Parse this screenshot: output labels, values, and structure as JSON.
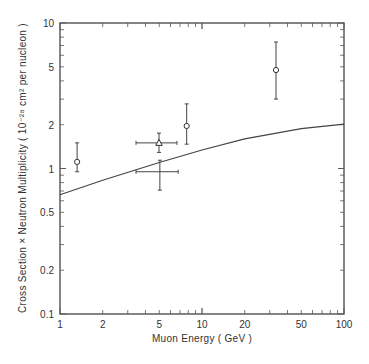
{
  "chart_data": {
    "type": "scatter",
    "title": "",
    "xlabel": "Muon Energy   ( GeV )",
    "ylabel": "Cross Section × Neutron Multiplicity ( 10⁻²⁸ cm² per nucleon )",
    "xscale": "log",
    "yscale": "log",
    "xlim": [
      1,
      100
    ],
    "ylim": [
      0.1,
      10
    ],
    "grid": false,
    "legend": null,
    "x_ticks": [
      1,
      2,
      5,
      10,
      20,
      50,
      100
    ],
    "x_tick_labels": [
      "1",
      "2",
      "5",
      "10",
      "20",
      "50",
      "100"
    ],
    "y_ticks": [
      0.1,
      0.2,
      0.5,
      1,
      2,
      5,
      10
    ],
    "y_tick_labels": [
      "0.1",
      "0.2",
      "0.5",
      "1",
      "2",
      "5",
      "10"
    ],
    "series": [
      {
        "name": "circle data points",
        "marker": "open-circle",
        "points": [
          {
            "x": 1.32,
            "y": 1.11,
            "y_low": 0.95,
            "y_high": 1.5
          },
          {
            "x": 7.8,
            "y": 1.96,
            "y_low": 1.47,
            "y_high": 2.78
          },
          {
            "x": 33.2,
            "y": 4.75,
            "y_low": 3.0,
            "y_high": 7.4
          }
        ]
      },
      {
        "name": "triangle data point",
        "marker": "open-triangle",
        "points": [
          {
            "x": 4.98,
            "y": 1.5,
            "x_low": 3.43,
            "x_high": 6.66,
            "y_low": 1.29,
            "y_high": 1.75
          }
        ]
      },
      {
        "name": "cross data point",
        "marker": "cross",
        "points": [
          {
            "x": 5.05,
            "y": 0.95,
            "x_low": 3.43,
            "x_high": 6.8,
            "y_low": 0.71,
            "y_high": 1.14
          }
        ]
      },
      {
        "name": "theory curve",
        "type": "line",
        "points": [
          {
            "x": 1,
            "y": 0.66
          },
          {
            "x": 2,
            "y": 0.83
          },
          {
            "x": 5,
            "y": 1.1
          },
          {
            "x": 10,
            "y": 1.34
          },
          {
            "x": 20,
            "y": 1.6
          },
          {
            "x": 50,
            "y": 1.88
          },
          {
            "x": 100,
            "y": 2.02
          }
        ]
      }
    ]
  }
}
